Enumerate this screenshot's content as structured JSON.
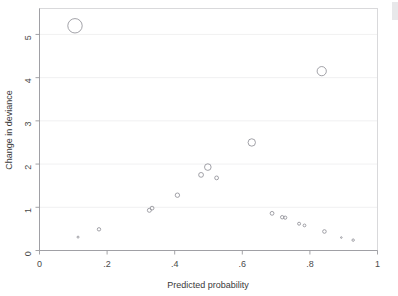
{
  "figure": {
    "name": "influence-diagnostic-bubble-plot",
    "background_color": "#ffffff",
    "marker_color": "#8a8a92",
    "grid_color": "#ececed",
    "axis_color": "#9a9a9e"
  },
  "chart_data": {
    "type": "scatter",
    "title": "",
    "xlabel": "Predicted probability",
    "ylabel": "Change in deviance",
    "xlim": [
      0,
      1
    ],
    "ylim": [
      0,
      5.6
    ],
    "xticks": [
      0,
      0.2,
      0.4,
      0.6,
      0.8,
      1
    ],
    "xticklabels": [
      "0",
      ".2",
      ".4",
      ".6",
      ".8",
      "1"
    ],
    "yticks": [
      0,
      1,
      2,
      3,
      4,
      5
    ],
    "yticklabels": [
      "0",
      "1",
      "2",
      "3",
      "4",
      "5"
    ],
    "grid": "horizontal",
    "legend": "none",
    "marker_style": "open-circle",
    "size_encoding": "leverage (circle area)",
    "points": [
      {
        "x": 0.105,
        "y": 5.2,
        "size": 7.2
      },
      {
        "x": 0.835,
        "y": 4.15,
        "size": 4.6
      },
      {
        "x": 0.628,
        "y": 2.5,
        "size": 3.7
      },
      {
        "x": 0.498,
        "y": 1.93,
        "size": 3.3
      },
      {
        "x": 0.478,
        "y": 1.75,
        "size": 2.4
      },
      {
        "x": 0.524,
        "y": 1.68,
        "size": 1.9
      },
      {
        "x": 0.408,
        "y": 1.28,
        "size": 2.2
      },
      {
        "x": 0.333,
        "y": 0.98,
        "size": 1.9
      },
      {
        "x": 0.325,
        "y": 0.93,
        "size": 2.0
      },
      {
        "x": 0.688,
        "y": 0.86,
        "size": 1.9
      },
      {
        "x": 0.718,
        "y": 0.77,
        "size": 1.7
      },
      {
        "x": 0.727,
        "y": 0.76,
        "size": 1.6
      },
      {
        "x": 0.768,
        "y": 0.62,
        "size": 1.5
      },
      {
        "x": 0.784,
        "y": 0.58,
        "size": 1.4
      },
      {
        "x": 0.843,
        "y": 0.44,
        "size": 1.8
      },
      {
        "x": 0.176,
        "y": 0.49,
        "size": 1.7
      },
      {
        "x": 0.114,
        "y": 0.31,
        "size": 1.0
      },
      {
        "x": 0.893,
        "y": 0.3,
        "size": 0.8
      },
      {
        "x": 0.928,
        "y": 0.24,
        "size": 1.2
      }
    ]
  }
}
